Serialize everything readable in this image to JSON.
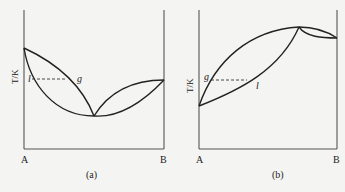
{
  "panels": [
    {
      "id": "a",
      "caption": "(a)",
      "y_axis_label": "T/K",
      "x_left_label": "A",
      "x_right_label": "B",
      "point_labels": {
        "liquid": "l",
        "gas": "g"
      },
      "description": "Minimum-boiling azeotrope T-x diagram: two lens-shaped regions meeting at a minimum temperature point; dashed tie line between l and g"
    },
    {
      "id": "b",
      "caption": "(b)",
      "y_axis_label": "T/K",
      "x_left_label": "A",
      "x_right_label": "B",
      "point_labels": {
        "gas": "g",
        "liquid": "l"
      },
      "description": "Maximum-boiling azeotrope T-x diagram: two lens-shaped regions meeting at a maximum temperature point near B; dashed tie line between g and l"
    }
  ]
}
